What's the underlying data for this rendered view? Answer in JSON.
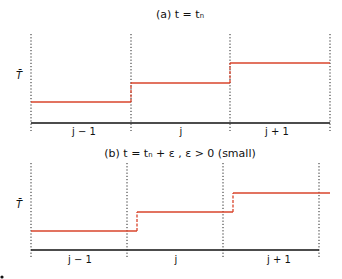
{
  "panels": [
    {
      "id": "a",
      "title": "(a) t = tₙ",
      "ylabel": "T̄",
      "cells": [
        "j − 1",
        "j",
        "j + 1"
      ],
      "description": "Piecewise-constant cell averages at t = t_n; jumps located exactly at cell interfaces",
      "geom": {
        "boundaries_x": [
          31,
          131,
          230,
          330
        ],
        "top_y": 34,
        "bottom_y": 131,
        "axis_y": 123,
        "axis_x1": 31,
        "axis_x2": 330,
        "levels_y": [
          102,
          83,
          63
        ],
        "segments": [
          [
            31,
            131,
            102
          ],
          [
            131,
            230,
            83
          ],
          [
            230,
            330,
            63
          ]
        ],
        "jumps": [
          [
            131,
            102,
            83
          ],
          [
            230,
            83,
            63
          ]
        ],
        "title_x": 180,
        "title_y": 18,
        "ylabel_x": 19,
        "ylabel_y": 79,
        "cell_label_y": 135,
        "cell_label_x": [
          84,
          181,
          277
        ]
      }
    },
    {
      "id": "b",
      "title": "(b) t = tₙ + ε , ε > 0 (small)",
      "ylabel": "T̄",
      "cells": [
        "j − 1",
        "j",
        "j + 1"
      ],
      "description": "Slightly later time: discontinuities advected just to the right of interfaces",
      "geom": {
        "boundaries_x": [
          31,
          127,
          223,
          319
        ],
        "top_y": 163,
        "bottom_y": 259,
        "axis_y": 250,
        "axis_x1": 31,
        "axis_x2": 319,
        "levels_y": [
          231,
          212,
          193
        ],
        "segments": [
          [
            31,
            137,
            231
          ],
          [
            137,
            233,
            212
          ],
          [
            233,
            330,
            193
          ]
        ],
        "jumps": [
          [
            137,
            231,
            212
          ],
          [
            233,
            212,
            193
          ]
        ],
        "title_x": 180,
        "title_y": 157,
        "ylabel_x": 19,
        "ylabel_y": 208,
        "cell_label_y": 263,
        "cell_label_x": [
          80,
          176,
          279
        ]
      }
    }
  ],
  "colors": {
    "step_line": "#d9442b",
    "axis": "#111111",
    "dotted": "#222222",
    "text": "#111111",
    "background": "#ffffff"
  },
  "chart_data": [
    {
      "type": "line",
      "title": "(a) t = t_n",
      "xlabel": "",
      "ylabel": "T̄",
      "categories": [
        "j-1",
        "j",
        "j+1"
      ],
      "series": [
        {
          "name": "cell average T̄",
          "values": [
            1,
            2,
            3
          ],
          "style": "step, jumps at interfaces"
        }
      ],
      "grid": false
    },
    {
      "type": "line",
      "title": "(b) t = t_n + ε , ε > 0 (small)",
      "xlabel": "",
      "ylabel": "T̄",
      "categories": [
        "j-1",
        "j",
        "j+1"
      ],
      "series": [
        {
          "name": "T̄",
          "values": [
            1,
            2,
            3
          ],
          "style": "step, jumps shifted right of interfaces (dashed)"
        }
      ],
      "grid": false
    }
  ]
}
